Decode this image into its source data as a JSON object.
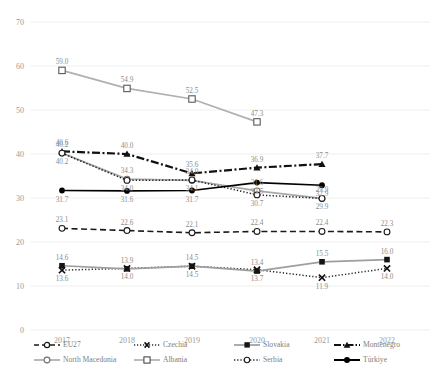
{
  "chart_data": {
    "type": "line",
    "title": "",
    "xlabel": "",
    "ylabel": "",
    "categories": [
      "2017",
      "2018",
      "2019",
      "2020",
      "2021",
      "2022"
    ],
    "ylim": [
      0,
      70
    ],
    "yticks": [
      0,
      10,
      20,
      30,
      40,
      50,
      60,
      70
    ],
    "grid": true,
    "legend_position": "bottom",
    "series": [
      {
        "name": "EU27",
        "marker": "open-circle",
        "line": "dashed",
        "color": "#1a1a1a",
        "values": [
          23.1,
          22.6,
          22.1,
          22.4,
          22.4,
          22.3
        ],
        "labels": [
          "23.1",
          "22.6",
          "22.1",
          "22.4",
          "22.4",
          "22.3"
        ]
      },
      {
        "name": "Czechia",
        "marker": "x-cross",
        "line": "dotted",
        "color": "#2b2b2b",
        "values": [
          13.6,
          14.0,
          14.5,
          13.7,
          11.9,
          14.0
        ],
        "labels": [
          "13.6",
          "14.0",
          "14.5",
          "13.7",
          "11.9",
          "14.0"
        ]
      },
      {
        "name": "Slovakia",
        "marker": "filled-square",
        "line": "solid",
        "color": "#9e9e9e",
        "values": [
          14.6,
          13.9,
          14.5,
          13.4,
          15.5,
          16.0
        ],
        "labels": [
          "14.6",
          "13.9",
          "14.5",
          "13.4",
          "15.5",
          "16.0"
        ]
      },
      {
        "name": "Montenegro",
        "marker": "filled-triangle",
        "line": "dash-dot",
        "color": "#111111",
        "values": [
          40.6,
          40.0,
          35.6,
          36.9,
          37.7,
          null
        ],
        "labels": [
          "40.6",
          "40.0",
          "35.6",
          "36.9",
          "37.7",
          ""
        ]
      },
      {
        "name": "North Macedonia",
        "marker": "open-circle",
        "line": "solid",
        "color": "#a8a8a8",
        "values": [
          40.2,
          34.3,
          34.0,
          31.6,
          29.9,
          null
        ],
        "labels": [
          "40.2",
          "34.3",
          "34.0",
          "31.6",
          "29.9",
          ""
        ]
      },
      {
        "name": "Albania",
        "marker": "open-square",
        "line": "solid",
        "color": "#b0b0b0",
        "values": [
          59.0,
          54.9,
          52.5,
          47.3,
          null,
          null
        ],
        "labels": [
          "59.0",
          "54.9",
          "52.5",
          "47.3",
          "",
          ""
        ]
      },
      {
        "name": "Serbia",
        "marker": "open-circle",
        "line": "dotted",
        "color": "#1f1f1f",
        "values": [
          40.2,
          34.0,
          34.1,
          30.7,
          29.9,
          null
        ],
        "labels": [
          "40.2",
          "34.0",
          "34.1",
          "30.7",
          "29.9",
          ""
        ]
      },
      {
        "name": "Türkiye",
        "marker": "filled-circle",
        "line": "solid",
        "color": "#000000",
        "values": [
          31.7,
          31.6,
          31.7,
          33.5,
          32.9,
          null
        ],
        "labels": [
          "31.7",
          "31.6",
          "31.7",
          "33.5",
          "32.9",
          ""
        ]
      }
    ]
  },
  "legend": {
    "row1": [
      {
        "label": "EU27"
      },
      {
        "label": "Czechia"
      },
      {
        "label": "Slovakia"
      },
      {
        "label": "Montenegro"
      }
    ],
    "row2": [
      {
        "label": "North Macedonia"
      },
      {
        "label": "Albania"
      },
      {
        "label": "Serbia"
      },
      {
        "label": "Türkiye"
      }
    ]
  },
  "axis": {
    "y_labels": [
      "70",
      "60",
      "50",
      "40",
      "30",
      "20",
      "10",
      "0"
    ],
    "x_labels": [
      "2017",
      "2018",
      "2019",
      "2020",
      "2021",
      "2022"
    ]
  }
}
